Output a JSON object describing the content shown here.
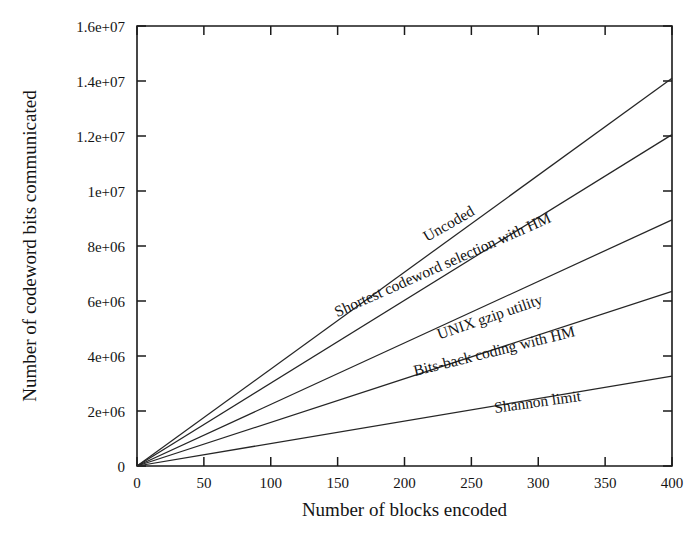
{
  "chart_data": {
    "type": "line",
    "title": "",
    "subtitle": "",
    "xlabel": "Number of blocks encoded",
    "ylabel": "Number of codeword bits communicated",
    "xlim": [
      0,
      400
    ],
    "ylim": [
      0,
      16000000
    ],
    "xticks": [
      0,
      50,
      100,
      150,
      200,
      250,
      300,
      350,
      400
    ],
    "xtick_labels": [
      "0",
      "50",
      "100",
      "150",
      "200",
      "250",
      "300",
      "350",
      "400"
    ],
    "yticks": [
      0,
      2000000,
      4000000,
      6000000,
      8000000,
      10000000,
      12000000,
      14000000,
      16000000
    ],
    "ytick_labels": [
      "0",
      "2e+06",
      "4e+06",
      "6e+06",
      "8e+06",
      "1e+07",
      "1.2e+07",
      "1.4e+07",
      "1.6e+07"
    ],
    "grid": false,
    "legend": "inline-labels",
    "x": [
      0,
      400
    ],
    "series": [
      {
        "name": "Uncoded",
        "label": "Uncoded",
        "values": [
          0,
          14100000
        ],
        "slope_per_block": 35250,
        "label_x": 235,
        "label_y": 8650000,
        "label_rotation": -30,
        "color": "#262626"
      },
      {
        "name": "Shortest codeword selection with HM",
        "label": "Shortest codeword selection with HM",
        "values": [
          0,
          12050000
        ],
        "slope_per_block": 30125,
        "label_x": 230,
        "label_y": 7150000,
        "label_rotation": -24,
        "color": "#262626"
      },
      {
        "name": "UNIX gzip utility",
        "label": "UNIX gzip utility",
        "values": [
          0,
          8950000
        ],
        "slope_per_block": 22375,
        "label_x": 265,
        "label_y": 5250000,
        "label_rotation": -19,
        "color": "#262626"
      },
      {
        "name": "Bits-back coding with HM",
        "label": "Bits-back coding with HM",
        "values": [
          0,
          6350000
        ],
        "slope_per_block": 15875,
        "label_x": 268,
        "label_y": 4000000,
        "label_rotation": -14,
        "color": "#262626"
      },
      {
        "name": "Shannon limit",
        "label": "Shannon limit",
        "values": [
          0,
          3270000
        ],
        "slope_per_block": 8175,
        "label_x": 300,
        "label_y": 2150000,
        "label_rotation": -8,
        "color": "#262626"
      }
    ]
  },
  "colors": {
    "background": "#ffffff",
    "axis": "#1a1a1a",
    "line": "#262626",
    "text": "#141414"
  }
}
